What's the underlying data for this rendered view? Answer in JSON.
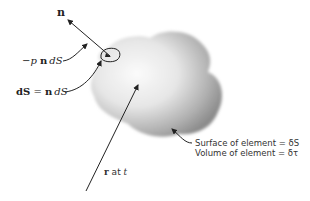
{
  "diagram": {
    "labels": {
      "normal_vector": "n",
      "pressure_force": "−p n dS",
      "pressure_force_parts": {
        "minus_p": "−p ",
        "n": "n",
        "dS": "dS"
      },
      "area_vector": "dS = n dS",
      "area_vector_parts": {
        "dS_bold": "dS",
        "eq": " = ",
        "n": "n",
        "dS": "dS"
      },
      "position": "r at t",
      "position_parts": {
        "r": "r",
        "at": " at ",
        "t": "t"
      },
      "surface": "Surface of element = δS",
      "volume": "Volume of element = δτ"
    },
    "colors": {
      "line": "#222222",
      "blob_light": "#f4f4f4",
      "blob_dark": "#8a8a8a"
    }
  }
}
